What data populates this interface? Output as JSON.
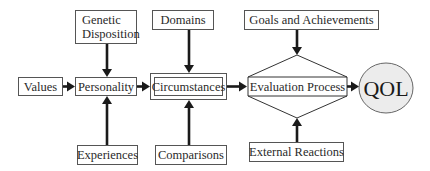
{
  "diagram": {
    "nodes": {
      "genetic_line1": "Genetic",
      "genetic_line2": "Disposition",
      "domains": "Domains",
      "goals": "Goals and Achievements",
      "values": "Values",
      "personality": "Personality",
      "circumstances": "Circumstances",
      "evaluation": "Evaluation Process",
      "qol": "QOL",
      "experiences": "Experiences",
      "comparisons": "Comparisons",
      "external": "External Reactions"
    },
    "edges": [
      {
        "from": "Genetic Disposition",
        "to": "Personality"
      },
      {
        "from": "Experiences",
        "to": "Personality"
      },
      {
        "from": "Values",
        "to": "Personality"
      },
      {
        "from": "Personality",
        "to": "Circumstances"
      },
      {
        "from": "Domains",
        "to": "Circumstances"
      },
      {
        "from": "Comparisons",
        "to": "Circumstances"
      },
      {
        "from": "Circumstances",
        "to": "Evaluation Process"
      },
      {
        "from": "Goals and Achievements",
        "to": "Evaluation Process"
      },
      {
        "from": "External Reactions",
        "to": "Evaluation Process"
      },
      {
        "from": "Evaluation Process",
        "to": "QOL"
      }
    ],
    "colors": {
      "stroke": "#555555",
      "arrow": "#1a1a1a",
      "qol_fill": "#ececec"
    }
  }
}
